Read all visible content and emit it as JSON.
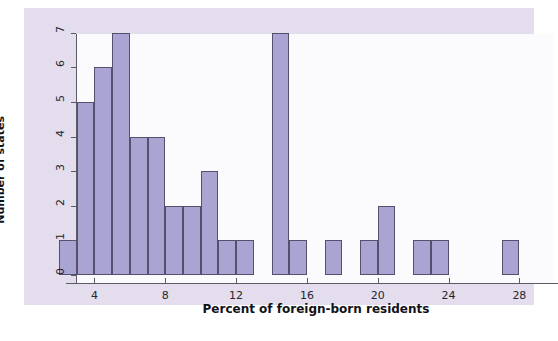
{
  "chart_data": {
    "type": "bar",
    "title": "",
    "subtitle": "",
    "xlabel": "Percent of foreign-born residents",
    "ylabel": "Number of states",
    "xlim": [
      1.6,
      28.6
    ],
    "ylim": [
      0,
      7.3
    ],
    "bin_width": 1,
    "grid": false,
    "legend": null,
    "xticks": [
      4,
      8,
      12,
      16,
      20,
      24,
      28
    ],
    "xtick_labels": [
      "4",
      "8",
      "12",
      "16",
      "20",
      "24",
      "28"
    ],
    "yticks": [
      0,
      1,
      2,
      3,
      4,
      5,
      6,
      7
    ],
    "ytick_labels": [
      "0",
      "1",
      "2",
      "3",
      "4",
      "5",
      "6",
      "7"
    ],
    "bin_starts": [
      2,
      3,
      4,
      5,
      6,
      7,
      8,
      9,
      10,
      11,
      12,
      13,
      14,
      15,
      16,
      17,
      18,
      19,
      20,
      21,
      22,
      23,
      24,
      25,
      26,
      27
    ],
    "values": [
      1,
      5,
      6,
      7,
      4,
      4,
      2,
      2,
      3,
      1,
      1,
      0,
      7,
      1,
      0,
      1,
      0,
      1,
      2,
      0,
      1,
      1,
      0,
      0,
      0,
      1
    ],
    "bar_color": "#aaa4d2",
    "bar_edge_color": "#55506e",
    "panel_color": "#e3dded",
    "plot_background": "#fbfafd",
    "axis_color": "#5b5b66"
  }
}
